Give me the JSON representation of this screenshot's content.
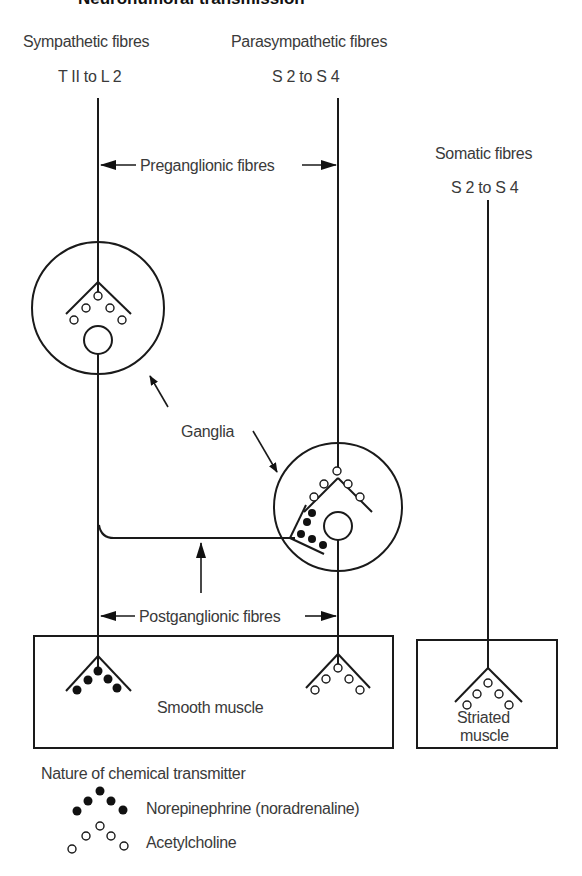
{
  "title": "Neurohumoral transmission",
  "fibres": {
    "sympathetic": {
      "label": "Sympathetic fibres",
      "range": "T II to L 2"
    },
    "parasympathetic": {
      "label": "Parasympathetic fibres",
      "range": "S 2 to S 4"
    },
    "somatic": {
      "label": "Somatic fibres",
      "range": "S 2 to S 4"
    }
  },
  "annotations": {
    "preganglionic": "Preganglionic fibres",
    "postganglionic": "Postganglionic fibres",
    "ganglia": "Ganglia"
  },
  "targets": {
    "smooth_muscle": "Smooth muscle",
    "striated_muscle_line1": "Striated",
    "striated_muscle_line2": "muscle"
  },
  "legend": {
    "heading": "Nature of chemical transmitter",
    "items": [
      {
        "symbol": "filled-dots",
        "label": "Norepinephrine (noradrenaline)"
      },
      {
        "symbol": "open-dots",
        "label": "Acetylcholine"
      }
    ]
  }
}
